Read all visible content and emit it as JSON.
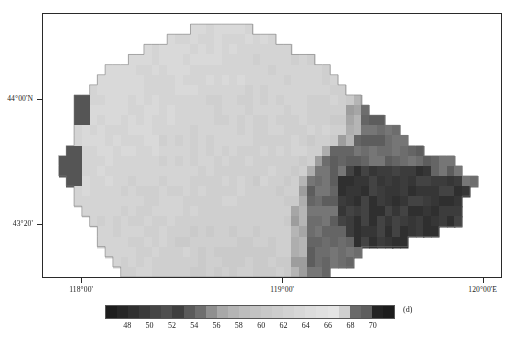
{
  "figure": {
    "type": "choropleth-raster-map"
  },
  "axes": {
    "x_ticks": [
      {
        "label": "118°00'",
        "pos": 0.085
      },
      {
        "label": "119°00'",
        "pos": 0.522
      },
      {
        "label": "120°00'E",
        "pos": 0.958
      }
    ],
    "y_ticks": [
      {
        "label": "44°00'N",
        "pos": 0.323
      },
      {
        "label": "43°20'",
        "pos": 0.795
      }
    ]
  },
  "colorbar": {
    "unit": "(d)",
    "tick_labels": [
      "48",
      "50",
      "52",
      "54",
      "56",
      "58",
      "60",
      "62",
      "64",
      "66",
      "68",
      "70"
    ],
    "tick_values": [
      48,
      50,
      52,
      54,
      56,
      58,
      60,
      62,
      64,
      66,
      68,
      70
    ],
    "vmin": 46,
    "vmax": 72,
    "swatches": [
      "#1d1d1d",
      "#262626",
      "#303030",
      "#3a3a3a",
      "#454545",
      "#4f4f4f",
      "#3f3f3f",
      "#5a5a5a",
      "#6e6e6e",
      "#8f8f8f",
      "#a8a8a8",
      "#b4b4b4",
      "#bdbdbd",
      "#c3c3c3",
      "#c8c8c8",
      "#cdcdcd",
      "#d2d2d2",
      "#d7d7d7",
      "#dcdcdc",
      "#e0e0e0",
      "#e4e4e4",
      "#cfcfcf",
      "#6a6a6a",
      "#5e5e5e",
      "#232323",
      "#1c1c1c"
    ]
  },
  "chart_data": {
    "type": "heatmap",
    "title": "",
    "xlabel": "",
    "ylabel": "",
    "unit": "(d)",
    "vmin": 46,
    "vmax": 72,
    "cell_px": 9,
    "grid_cols": 51,
    "grid_rows": 29,
    "xlim": [
      "117°50'",
      "120°10'"
    ],
    "ylim": [
      "43°05'",
      "44°30'"
    ],
    "note": "Values are days (d); low values dark, mid values light, highest values dark again.",
    "rows": [
      "...........................................................",
      "...................66666666..............................",
      "................66666666666666...........................",
      ".............6666666666666666666.........................",
      "...........666666666666666666666666......................",
      "........66666666666666666666666666666....................",
      ".......6666666666666666666666666666666...................",
      "......666666666666666666666666666666666..................",
      "....4866666666666666666666666666666666665................",
      "....48666666666666666666666666666666666552...............",
      "....4866666666666666666666666666666666655222.............",
      "....666666666666666666666666666666666665522222...........",
      "....6666666666666666666666666666666666552222222..........",
      "...4866666666666666666666666666666665222222222222........",
      "..488666666666666666666666666666666522222222222222222....",
      "..4886666666666666666666666666666652222111111111112222...",
      "...88666666666666666666666666666652222111111111111111122.",
      "....666666666666666666666666666665222211111111111111111..",
      "....66666666666666666666666666666522221111111111111111...",
      ".....6666666666666666666666666665522221111111111111111...",
      "......666666666666666666666666665522221111111111111111...",
      ".......66666666666666666666666665522222111111111111......",
      ".......6666666666666666666666666552222221111111..........",
      "........666666666666666666666666552222222................",
      ".........6666666666666666666666655222222.................",
      "..........666666666666666666666655222...................."
    ],
    "legend_position": "bottom"
  }
}
